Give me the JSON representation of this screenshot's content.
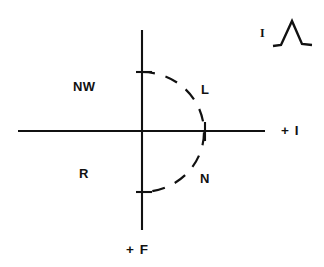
{
  "figure": {
    "background_color": "#ffffff",
    "stroke_color": "#111111",
    "axes": {
      "horizontal": {
        "name": "horizontal-axis",
        "label": "+ I",
        "label_position": "right",
        "x_start": 18,
        "x_end": 265,
        "y": 131
      },
      "vertical": {
        "name": "vertical-axis",
        "label": "+ F",
        "label_position": "bottom",
        "x": 142,
        "y_start": 30,
        "y_end": 230
      },
      "origin": {
        "x": 142,
        "y": 131
      }
    },
    "arc": {
      "name": "dashed-semicircle",
      "style": "dashed",
      "center": {
        "x": 142,
        "y": 132
      },
      "radius": 62,
      "bulge_direction": "right",
      "start_point": {
        "x": 142,
        "y": 72
      },
      "apex_point": {
        "x": 205,
        "y": 131
      },
      "end_point": {
        "x": 142,
        "y": 192
      }
    },
    "ticks": [
      {
        "name": "tick-upper-vertical",
        "axis": "vertical",
        "x": 142,
        "y": 72
      },
      {
        "name": "tick-lower-vertical",
        "axis": "vertical",
        "x": 142,
        "y": 192
      },
      {
        "name": "tick-horizontal-arc-crossing",
        "axis": "horizontal",
        "x": 205,
        "y": 131
      }
    ],
    "region_labels": [
      {
        "key": "nw",
        "text": "NW",
        "quadrant": "upper-left"
      },
      {
        "key": "l",
        "text": "L",
        "quadrant": "upper-right"
      },
      {
        "key": "r",
        "text": "R",
        "quadrant": "lower-left"
      },
      {
        "key": "n",
        "text": "N",
        "quadrant": "lower-right"
      }
    ],
    "inset": {
      "name": "peak-waveform-inset",
      "label": "I",
      "glyph": "peak-waveform-icon",
      "description": "triangular peak with flat baseline"
    }
  }
}
